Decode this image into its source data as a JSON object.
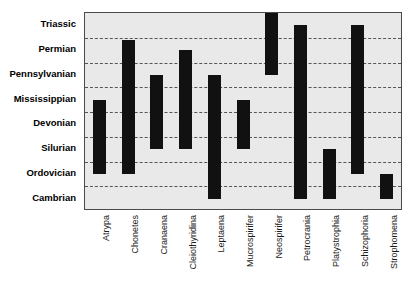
{
  "title_remnant": "",
  "chart_data": {
    "type": "bar",
    "chart_subtype": "range-bar / stratigraphic-range-chart",
    "title": "",
    "xlabel": "",
    "ylabel": "",
    "orientation": "vertical",
    "grid": true,
    "grid_style": "dashed-horizontal",
    "legend": "none",
    "y_axis_type": "ordinal-geologic-periods",
    "y_categories_bottom_to_top": [
      "Cambrian",
      "Ordovician",
      "Silurian",
      "Devonian",
      "Mississippian",
      "Pennsylvanian",
      "Permian",
      "Triassic"
    ],
    "y_categories_top_to_bottom": [
      "Triassic",
      "Permian",
      "Pennsylvanian",
      "Mississippian",
      "Devonian",
      "Silurian",
      "Ordovician",
      "Cambrian"
    ],
    "categories": [
      "Atrypa",
      "Chonetes",
      "Cranaena",
      "Cleiothyridina",
      "Leptaena",
      "Mucrospirifer",
      "Neospirifer",
      "Petrocrania",
      "Platystrophia",
      "Schizophoria",
      "Strophomena"
    ],
    "ranges": [
      {
        "name": "Atrypa",
        "top_period": "Mississippian",
        "bottom_period": "Silurian",
        "top_index": 4.5,
        "bottom_index": 1.5
      },
      {
        "name": "Chonetes",
        "top_period": "Permian",
        "bottom_period": "Silurian",
        "top_index": 6.9,
        "bottom_index": 1.5
      },
      {
        "name": "Cranaena",
        "top_period": "Pennsylvanian",
        "bottom_period": "Devonian",
        "top_index": 5.5,
        "bottom_index": 2.5
      },
      {
        "name": "Cleiothyridina",
        "top_period": "Permian",
        "bottom_period": "Devonian",
        "top_index": 6.5,
        "bottom_index": 2.5
      },
      {
        "name": "Leptaena",
        "top_period": "Pennsylvanian",
        "bottom_period": "Ordovician",
        "top_index": 5.5,
        "bottom_index": 0.5
      },
      {
        "name": "Mucrospirifer",
        "top_period": "Mississippian",
        "bottom_period": "Devonian",
        "top_index": 4.5,
        "bottom_index": 2.5
      },
      {
        "name": "Neospirifer",
        "top_period": "Triassic",
        "bottom_period": "Permian",
        "top_index": 8.0,
        "bottom_index": 5.5
      },
      {
        "name": "Petrocrania",
        "top_period": "Permian",
        "bottom_period": "Ordovician",
        "top_index": 7.5,
        "bottom_index": 0.5
      },
      {
        "name": "Platystrophia",
        "top_period": "Silurian",
        "bottom_period": "Ordovician",
        "top_index": 2.5,
        "bottom_index": 0.5
      },
      {
        "name": "Schizophoria",
        "top_period": "Permian",
        "bottom_period": "Silurian",
        "top_index": 7.5,
        "bottom_index": 1.5
      },
      {
        "name": "Strophomena",
        "top_period": "Ordovician",
        "bottom_period": "Ordovician",
        "top_index": 1.5,
        "bottom_index": 0.5
      }
    ]
  },
  "style": {
    "plot_background": "#e9e9e9",
    "bar_color": "#111111",
    "grid_color": "#555555",
    "border_color": "#4a4a4a",
    "page_background": "#ffffff"
  }
}
